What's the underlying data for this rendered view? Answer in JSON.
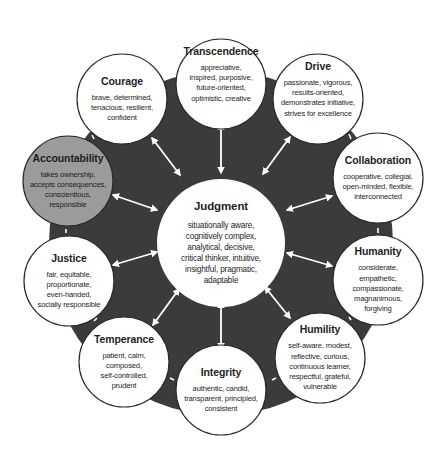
{
  "diagram": {
    "colors": {
      "background_disc": "#3b3b3b",
      "node_fill": "#ffffff",
      "node_highlight_fill": "#9b9b9b",
      "node_stroke": "#2a2a2a",
      "arrow": "#ffffff",
      "text": "#1e1e1e"
    },
    "center": {
      "title": "Judgment",
      "description": "situationally aware,\ncognitively complex,\nanalytical, decisive,\ncritical thinker, intuitive,\ninsightful, pragmatic,\nadaptable"
    },
    "nodes": [
      {
        "id": "transcendence",
        "title": "Transcendence",
        "description": "appreciative,\ninspired, purposive,\nfuture-oriented,\noptimistic, creative",
        "highlighted": false
      },
      {
        "id": "drive",
        "title": "Drive",
        "description": "passionate, vigorous,\nresults-oriented,\ndemonstrates initiative,\nstrives for excellence",
        "highlighted": false
      },
      {
        "id": "collaboration",
        "title": "Collaboration",
        "description": "cooperative, collegial,\nopen-minded, flexible,\ninterconnected",
        "highlighted": false
      },
      {
        "id": "humanity",
        "title": "Humanity",
        "description": "considerate,\nempathetic,\ncompassionate,\nmagnanimous,\nforgiving",
        "highlighted": false
      },
      {
        "id": "humility",
        "title": "Humility",
        "description": "self-aware, modest,\nreflective, curious,\ncontinuous learner,\nrespectful, grateful,\nvulnerable",
        "highlighted": false
      },
      {
        "id": "integrity",
        "title": "Integrity",
        "description": "authentic, candid,\ntransparent, principled,\nconsistent",
        "highlighted": false
      },
      {
        "id": "temperance",
        "title": "Temperance",
        "description": "patient, calm,\ncomposed,\nself-controlled,\nprudent",
        "highlighted": false
      },
      {
        "id": "justice",
        "title": "Justice",
        "description": "fair, equitable,\nproportionate,\neven-handed,\nsocially responsible",
        "highlighted": false
      },
      {
        "id": "accountability",
        "title": "Accountability",
        "description": "takes ownership,\naccepts consequences,\nconscientious,\nresponsible",
        "highlighted": true
      },
      {
        "id": "courage",
        "title": "Courage",
        "description": "brave, determined,\ntenacious, resilient,\nconfident",
        "highlighted": false
      }
    ],
    "connections": "bidirectional arrows from Judgment to each of the 10 surrounding dimensions"
  }
}
